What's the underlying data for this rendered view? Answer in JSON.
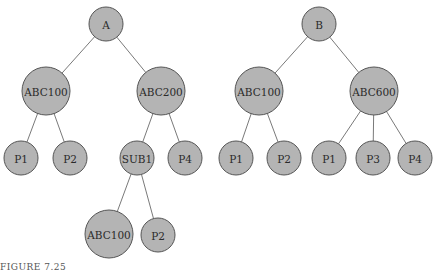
{
  "figure": {
    "caption": "FIGURE 7.25",
    "node_fill": "#b4b4b4",
    "node_stroke": "#555555",
    "edge_color": "#6a6a6a"
  },
  "trees": [
    {
      "name": "tree-a",
      "nodes": [
        {
          "id": "A",
          "label": "A",
          "x": 106,
          "y": 24,
          "r": 17
        },
        {
          "id": "A_ABC100",
          "label": "ABC100",
          "x": 46,
          "y": 91,
          "r": 24
        },
        {
          "id": "A_ABC200",
          "label": "ABC200",
          "x": 161,
          "y": 91,
          "r": 24
        },
        {
          "id": "A_P1",
          "label": "P1",
          "x": 21,
          "y": 158,
          "r": 17
        },
        {
          "id": "A_P2",
          "label": "P2",
          "x": 70,
          "y": 158,
          "r": 17
        },
        {
          "id": "A_SUB1",
          "label": "SUB1",
          "x": 137,
          "y": 158,
          "r": 17
        },
        {
          "id": "A_P4",
          "label": "P4",
          "x": 185,
          "y": 158,
          "r": 17
        },
        {
          "id": "A_SUB1_ABC100",
          "label": "ABC100",
          "x": 109,
          "y": 234,
          "r": 24
        },
        {
          "id": "A_SUB1_P2",
          "label": "P2",
          "x": 158,
          "y": 235,
          "r": 17
        }
      ],
      "edges": [
        [
          "A",
          "A_ABC100"
        ],
        [
          "A",
          "A_ABC200"
        ],
        [
          "A_ABC100",
          "A_P1"
        ],
        [
          "A_ABC100",
          "A_P2"
        ],
        [
          "A_ABC200",
          "A_SUB1"
        ],
        [
          "A_ABC200",
          "A_P4"
        ],
        [
          "A_SUB1",
          "A_SUB1_ABC100"
        ],
        [
          "A_SUB1",
          "A_SUB1_P2"
        ]
      ]
    },
    {
      "name": "tree-b",
      "nodes": [
        {
          "id": "B",
          "label": "B",
          "x": 319,
          "y": 24,
          "r": 17
        },
        {
          "id": "B_ABC100",
          "label": "ABC100",
          "x": 259,
          "y": 91,
          "r": 24
        },
        {
          "id": "B_ABC600",
          "label": "ABC600",
          "x": 374,
          "y": 91,
          "r": 24
        },
        {
          "id": "B_P1a",
          "label": "P1",
          "x": 236,
          "y": 158,
          "r": 17
        },
        {
          "id": "B_P2",
          "label": "P2",
          "x": 284,
          "y": 158,
          "r": 17
        },
        {
          "id": "B_P1b",
          "label": "P1",
          "x": 329,
          "y": 158,
          "r": 17
        },
        {
          "id": "B_P3",
          "label": "P3",
          "x": 373,
          "y": 158,
          "r": 17
        },
        {
          "id": "B_P4",
          "label": "P4",
          "x": 415,
          "y": 158,
          "r": 17
        }
      ],
      "edges": [
        [
          "B",
          "B_ABC100"
        ],
        [
          "B",
          "B_ABC600"
        ],
        [
          "B_ABC100",
          "B_P1a"
        ],
        [
          "B_ABC100",
          "B_P2"
        ],
        [
          "B_ABC600",
          "B_P1b"
        ],
        [
          "B_ABC600",
          "B_P3"
        ],
        [
          "B_ABC600",
          "B_P4"
        ]
      ]
    }
  ]
}
